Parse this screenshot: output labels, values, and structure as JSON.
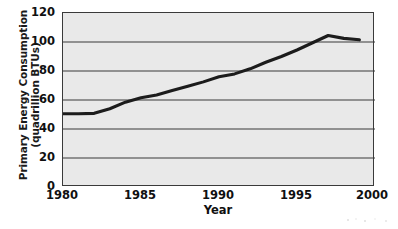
{
  "chart_data": {
    "type": "line",
    "title": "",
    "xlabel": "Year",
    "ylabel": "Primary Energy Consumption (quadrillion BTUs)",
    "ylabel_line1": "Primary Energy Consumption",
    "ylabel_line2": "(quadrillion BTUs)",
    "xlim": [
      1980,
      2000
    ],
    "ylim": [
      0,
      120
    ],
    "xticks": [
      1980,
      1985,
      1990,
      1995,
      2000
    ],
    "xtick_labels": [
      "1980",
      "1985",
      "1990",
      "1995",
      "2000"
    ],
    "yticks": [
      0,
      20,
      40,
      60,
      80,
      100,
      120
    ],
    "ytick_labels": [
      "0",
      "20",
      "40",
      "60",
      "80",
      "100",
      "120"
    ],
    "grid": "horizontal",
    "legend": "none",
    "plot_background": "#e9e9e9",
    "line_color": "#1c1c1c",
    "x": [
      1980,
      1981,
      1982,
      1983,
      1984,
      1985,
      1986,
      1987,
      1988,
      1989,
      1990,
      1991,
      1992,
      1993,
      1994,
      1995,
      1996,
      1997,
      1998,
      1999
    ],
    "values": [
      50.5,
      50.5,
      50.8,
      54.0,
      58.5,
      61.5,
      63.5,
      66.5,
      69.5,
      72.5,
      76.0,
      78.0,
      81.5,
      86.0,
      90.0,
      94.5,
      99.5,
      104.5,
      102.5,
      101.5
    ],
    "series": [
      {
        "name": "Primary Energy Consumption",
        "values": [
          50.5,
          50.5,
          50.8,
          54.0,
          58.5,
          61.5,
          63.5,
          66.5,
          69.5,
          72.5,
          76.0,
          78.0,
          81.5,
          86.0,
          90.0,
          94.5,
          99.5,
          104.5,
          102.5,
          101.5
        ]
      }
    ]
  }
}
